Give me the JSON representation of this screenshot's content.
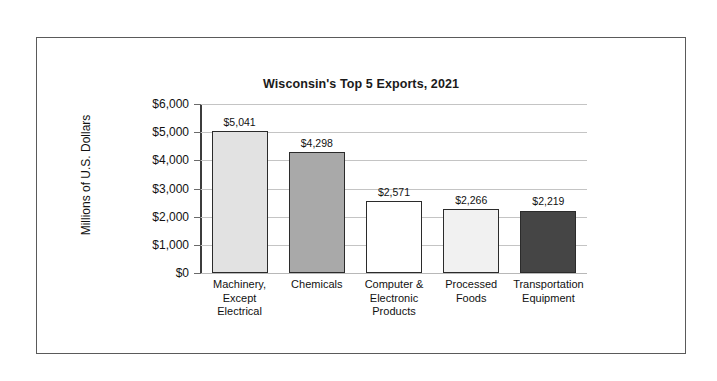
{
  "chart_data": {
    "type": "bar",
    "title": "Wisconsin's Top 5 Exports, 2021",
    "xlabel": "",
    "ylabel": "Millions of U.S. Dollars",
    "ylim": [
      0,
      6000
    ],
    "ytick_step": 1000,
    "ytick_labels": [
      "$6,000",
      "$5,000",
      "$4,000",
      "$3,000",
      "$2,000",
      "$1,000",
      "$0"
    ],
    "ytick_values": [
      6000,
      5000,
      4000,
      3000,
      2000,
      1000,
      0
    ],
    "grid": "horizontal",
    "legend": "none",
    "categories": [
      "Machinery, Except Electrical",
      "Chemicals",
      "Computer & Electronic Products",
      "Processed Foods",
      "Transportation Equipment"
    ],
    "category_label_lines": [
      [
        "Machinery,",
        "Except",
        "Electrical"
      ],
      [
        "Chemicals"
      ],
      [
        "Computer &",
        "Electronic",
        "Products"
      ],
      [
        "Processed",
        "Foods"
      ],
      [
        "Transportation",
        "Equipment"
      ]
    ],
    "values": [
      5041,
      4298,
      2571,
      2266,
      2219
    ],
    "value_labels": [
      "$5,041",
      "$4,298",
      "$2,571",
      "$2,266",
      "$2,219"
    ],
    "bar_colors": [
      "#e2e2e2",
      "#a9a9a9",
      "#ffffff",
      "#f1f1f1",
      "#454545"
    ],
    "bar_edge_color": "#2b2b2b"
  },
  "style": {
    "frame_color": "#5a5a5a",
    "gridline_color": "#c4c4c4",
    "axis_color": "#3c3c3c",
    "text_color": "#111111",
    "background": "#ffffff"
  }
}
